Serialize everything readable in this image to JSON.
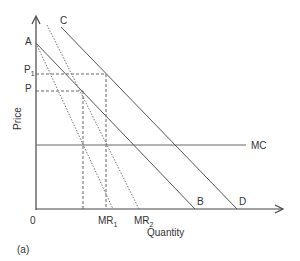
{
  "diagram": {
    "panel_label": "(a)",
    "axes": {
      "y_label": "Price",
      "x_label": "Quantity",
      "origin_label": "0"
    },
    "curves": {
      "demand_AB": {
        "start_label": "A",
        "end_label": "B"
      },
      "demand_CD": {
        "start_label": "C",
        "end_label": "D"
      },
      "mc": {
        "label": "MC"
      },
      "mr1": {
        "label": "MR",
        "sub": "1"
      },
      "mr2": {
        "label": "MR",
        "sub": "2"
      }
    },
    "price_levels": {
      "p1": {
        "label": "P",
        "sub": "1"
      },
      "p": {
        "label": "P"
      }
    },
    "colors": {
      "line": "#555555",
      "text": "#333333"
    }
  }
}
